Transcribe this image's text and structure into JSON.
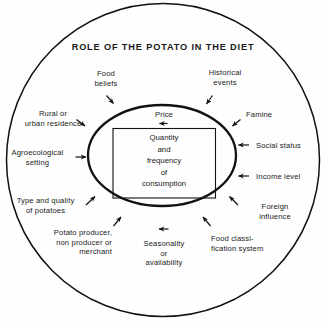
{
  "figure": {
    "title": "ROLE OF THE POTATO IN THE DIET",
    "core": {
      "box_text": "Quantity\nand\nfrequency\nof\nconsumption",
      "price_label": "Price"
    },
    "factors": [
      {
        "key": "food-beliefs",
        "label": "Food\nbeliefs"
      },
      {
        "key": "historical-events",
        "label": "Historical\nevents"
      },
      {
        "key": "rural-urban",
        "label": "Rural  or\nurban residence"
      },
      {
        "key": "famine",
        "label": "Famine"
      },
      {
        "key": "agroecological",
        "label": "Agroecological\nsetting"
      },
      {
        "key": "social-status",
        "label": "Social status"
      },
      {
        "key": "type-quality",
        "label": "Type and quality\nof potatoes"
      },
      {
        "key": "income-level",
        "label": "Income level"
      },
      {
        "key": "potato-producer",
        "label": "Potato producer,\nnon producer or\nmerchant"
      },
      {
        "key": "foreign-influence",
        "label": "Foreign\ninfluence"
      },
      {
        "key": "seasonality",
        "label": "Seasonality\nor\navailability"
      },
      {
        "key": "food-classification",
        "label": "Food classi-\nfication system"
      }
    ],
    "colors": {
      "stroke": "#121212",
      "background": "#fefefe",
      "text": "#1a1a1a"
    }
  }
}
